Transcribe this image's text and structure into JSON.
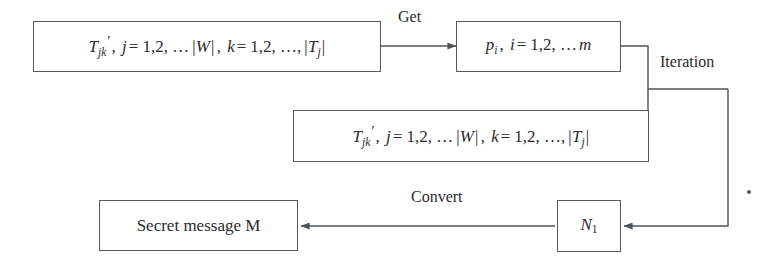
{
  "diagram": {
    "background_color": "#ffffff",
    "stroke_color": "#555a5e",
    "text_color": "#2b2b2b",
    "nodes": [
      {
        "id": "tjk-top",
        "kind": "formula",
        "plain_text": "T'_{jk}, j = 1,2, … |W|, k = 1,2, …, |T_j|",
        "parts": {
          "t": "T",
          "t_sub": "jk",
          "prime": "′",
          "comma1": ",",
          "j": "j",
          "eq1": "=",
          "range1": "1,2, …",
          "absW": "|W|",
          "comma2": ",",
          "k": "k",
          "eq2": "=",
          "range2": "1,2, …,",
          "absT": "|T",
          "absT_sub": "j",
          "absT_end": "|"
        }
      },
      {
        "id": "pi",
        "kind": "formula",
        "plain_text": "p_i, i = 1,2, … m",
        "parts": {
          "p": "p",
          "p_sub": "i",
          "comma1": ",",
          "i": "i",
          "eq1": "=",
          "range1": "1,2, …",
          "m": "m"
        }
      },
      {
        "id": "tjk-mid",
        "kind": "formula",
        "plain_text": "T'_{jk}, j = 1,2, … |W|, k = 1,2, …, |T_j|",
        "parts": {
          "t": "T",
          "t_sub": "jk",
          "prime": "′",
          "comma1": ",",
          "j": "j",
          "eq1": "=",
          "range1": "1,2, …",
          "absW": "|W|",
          "comma2": ",",
          "k": "k",
          "eq2": "=",
          "range2": "1,2, …,",
          "absT": "|T",
          "absT_sub": "j",
          "absT_end": "|"
        }
      },
      {
        "id": "secret-message",
        "kind": "text",
        "label": "Secret message M"
      },
      {
        "id": "n1",
        "kind": "formula",
        "plain_text": "N_1",
        "parts": {
          "n": "N",
          "n_sub": "1"
        }
      }
    ],
    "edge_labels": {
      "get": "Get",
      "iteration": "Iteration",
      "convert": "Convert"
    }
  }
}
